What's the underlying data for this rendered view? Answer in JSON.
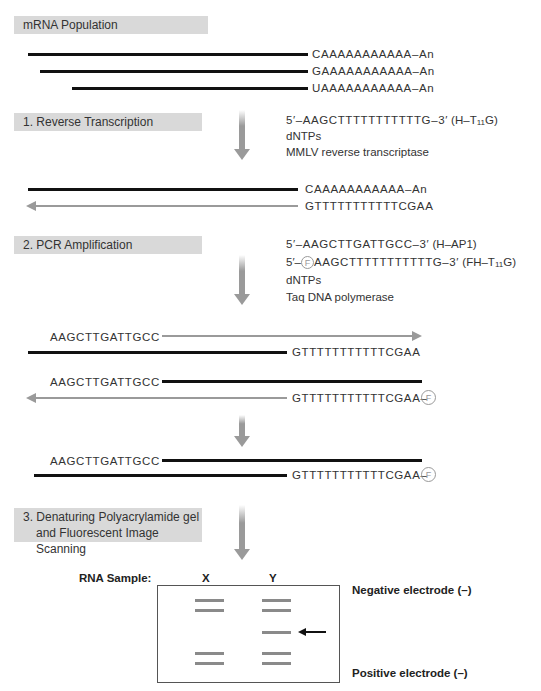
{
  "steps": {
    "mrna_population": "mRNA Population",
    "step1": "1.  Reverse Transcription",
    "step2": "2.  PCR Amplification",
    "step3_line1": "3.  Denaturing Polyacrylamide gel",
    "step3_line2": "and Fluorescent Image Scanning"
  },
  "mrna": {
    "seq1": "CAAAAAAAAAAA–An",
    "seq2": "GAAAAAAAAAAA–An",
    "seq3": "UAAAAAAAAAAA–An"
  },
  "rt": {
    "reagents": {
      "primer_seq": "5′–AAGCTTTTTTTTTTTG–3′",
      "primer_name_prefix": "(H–T",
      "primer_name_sub": "11",
      "primer_name_suffix": "G)",
      "dntps": "dNTPs",
      "enzyme": "MMLV reverse transcriptase"
    },
    "product_top": "CAAAAAAAAAAA–An",
    "product_bottom": "GTTTTTTTTTTTCGAA"
  },
  "pcr": {
    "reagents": {
      "primer1_seq": "5′–AAGCTTGATTGCC–3′",
      "primer1_name": "(H–AP1)",
      "primer2_prefix": "5′–",
      "fluor_label": "F",
      "primer2_seq": "AAGCTTTTTTTTTTTG–3′",
      "primer2_name_prefix": "(FH–T",
      "primer2_name_sub": "11",
      "primer2_name_suffix": "G)",
      "dntps": "dNTPs",
      "enzyme": "Taq DNA polymerase"
    },
    "cycle_a_top": "AAGCTTGATTGCC",
    "cycle_a_bottom": "GTTTTTTTTTTTCGAA",
    "cycle_b_top": "AAGCTTGATTGCC",
    "cycle_b_bottom": "GTTTTTTTTTTTCGAA–",
    "final_top": "AAGCTTGATTGCC",
    "final_bottom": "GTTTTTTTTTTTCGAA–"
  },
  "gel": {
    "sample_label": "RNA Sample:",
    "lane_x": "X",
    "lane_y": "Y",
    "negative": "Negative electrode (–)",
    "positive": "Positive electrode (–)",
    "lane_x_bands": 4,
    "lane_y_bands": 5
  },
  "colors": {
    "step_box": "#d9d9d9",
    "rna_strand": "#111111",
    "cdna_strand": "#9a9a9a",
    "band": "#8a8a8a"
  }
}
